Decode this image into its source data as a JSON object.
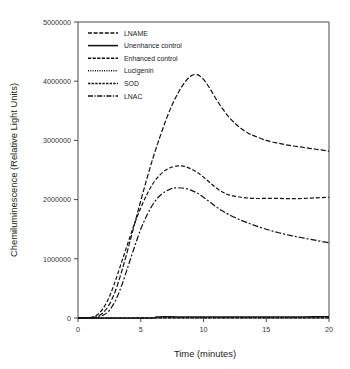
{
  "chart_data": {
    "type": "line",
    "title": "",
    "xlabel": "Time (minutes)",
    "ylabel": "Chemiluminescence (Relative Light Units)",
    "xlim": [
      0,
      20
    ],
    "ylim": [
      0,
      5000000
    ],
    "xticks": [
      0,
      5,
      10,
      15,
      20
    ],
    "yticks": [
      0,
      1000000,
      2000000,
      3000000,
      4000000,
      5000000
    ],
    "xticklabels": [
      "0",
      "5",
      "10",
      "15",
      "20"
    ],
    "yticklabels": [
      "0",
      "1000000",
      "2000000",
      "3000000",
      "4000000",
      "5000000"
    ],
    "grid": false,
    "legend_position": "upper left",
    "series": [
      {
        "name": "LNAME",
        "dash": "5,2",
        "x": [
          0,
          1,
          1.5,
          2,
          2.5,
          3,
          3.5,
          4,
          4.5,
          5,
          5.5,
          6,
          6.5,
          7,
          7.5,
          8,
          8.5,
          9,
          9.5,
          10,
          10.5,
          11,
          11.5,
          12,
          12.5,
          13,
          13.5,
          14,
          15,
          16,
          17,
          18,
          19,
          20
        ],
        "y": [
          0,
          5000,
          25000,
          90000,
          230000,
          470000,
          800000,
          1180000,
          1580000,
          1980000,
          2360000,
          2720000,
          3040000,
          3340000,
          3600000,
          3810000,
          3980000,
          4090000,
          4110000,
          4030000,
          3880000,
          3700000,
          3540000,
          3400000,
          3290000,
          3200000,
          3130000,
          3080000,
          3000000,
          2950000,
          2910000,
          2880000,
          2850000,
          2820000
        ]
      },
      {
        "name": "Enhanced control",
        "dash": "4,2",
        "x": [
          0,
          1,
          1.5,
          2,
          2.5,
          3,
          3.5,
          4,
          4.5,
          5,
          5.5,
          6,
          6.5,
          7,
          7.5,
          8,
          8.5,
          9,
          9.5,
          10,
          10.5,
          11,
          11.5,
          12,
          13,
          14,
          15,
          16,
          17,
          18,
          19,
          20
        ],
        "y": [
          0,
          10000,
          50000,
          160000,
          360000,
          640000,
          960000,
          1280000,
          1590000,
          1860000,
          2090000,
          2280000,
          2410000,
          2500000,
          2550000,
          2570000,
          2560000,
          2520000,
          2460000,
          2380000,
          2290000,
          2200000,
          2130000,
          2080000,
          2040000,
          2020000,
          2020000,
          2020000,
          2015000,
          2020000,
          2030000,
          2040000
        ]
      },
      {
        "name": "LNAC",
        "dash": "6,2,2,2",
        "x": [
          0,
          1,
          1.5,
          2,
          2.5,
          3,
          3.5,
          4,
          4.5,
          5,
          5.5,
          6,
          6.5,
          7,
          7.5,
          8,
          8.5,
          9,
          9.5,
          10,
          10.5,
          11,
          11.5,
          12,
          13,
          14,
          15,
          16,
          17,
          18,
          19,
          20
        ],
        "y": [
          0,
          3000,
          12000,
          45000,
          130000,
          300000,
          560000,
          880000,
          1200000,
          1500000,
          1740000,
          1930000,
          2060000,
          2140000,
          2190000,
          2200000,
          2190000,
          2160000,
          2110000,
          2040000,
          1960000,
          1880000,
          1810000,
          1750000,
          1650000,
          1570000,
          1500000,
          1440000,
          1390000,
          1350000,
          1310000,
          1270000
        ]
      },
      {
        "name": "Unenhance control",
        "dash": "none",
        "x": [
          0,
          2,
          4,
          6,
          6.3,
          8,
          10,
          12,
          14,
          16,
          18,
          20
        ],
        "y": [
          0,
          0,
          0,
          0,
          20000,
          21000,
          21000,
          21000,
          21000,
          21000,
          21000,
          22000
        ]
      },
      {
        "name": "Lucigenin",
        "dash": "1,1.5",
        "x": [
          0,
          2,
          4,
          6,
          8,
          10,
          12,
          14,
          16,
          18,
          20
        ],
        "y": [
          0,
          0,
          0,
          4000,
          5000,
          5000,
          5000,
          5000,
          5000,
          5000,
          6000
        ]
      },
      {
        "name": "SOD",
        "dash": "3,1.5",
        "x": [
          0,
          2,
          4,
          6,
          8,
          10,
          12,
          14,
          16,
          18,
          20
        ],
        "y": [
          0,
          0,
          0,
          2000,
          2500,
          2500,
          2500,
          2500,
          2500,
          2500,
          3000
        ]
      }
    ]
  },
  "legend": {
    "items": [
      {
        "label": "LNAME",
        "dash": "4,1.6"
      },
      {
        "label": "Unenhance control",
        "dash": "none"
      },
      {
        "label": "Enhanced control",
        "dash": "3.2,1.4"
      },
      {
        "label": "Lucigenin",
        "dash": "1,1.3"
      },
      {
        "label": "SOD",
        "dash": "2.4,1.2"
      },
      {
        "label": "LNAC",
        "dash": "5,1.5,1.2,1.5"
      }
    ]
  },
  "colors": {
    "line": "#111111",
    "axis": "#4a4a4a",
    "text": "#1a1a1a",
    "background": "#ffffff"
  }
}
